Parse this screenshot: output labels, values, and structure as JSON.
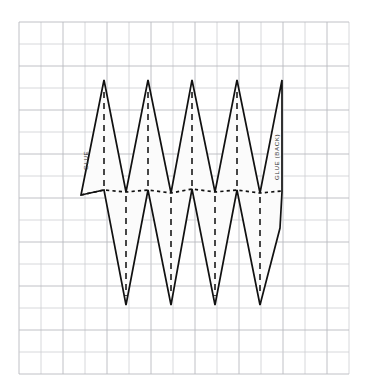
{
  "diagram": {
    "type": "papercraft-net",
    "background_color": "#ffffff",
    "grid": {
      "visible": true,
      "line_color": "#cdced2",
      "major_line_color": "#b9babf",
      "cell_size": 22,
      "origin_x": 19,
      "origin_y": 22,
      "columns": 15,
      "rows": 16
    },
    "net": {
      "fill_color": "#fbfbfb",
      "stroke_color": "#111111",
      "stroke_width": 1.7,
      "upper_peaks_x": [
        104,
        148,
        192,
        237,
        282
      ],
      "upper_peak_y": 80,
      "lower_valleys_x": [
        126,
        171,
        215,
        260
      ],
      "lower_valley_y": 305,
      "fold_line_y": 190,
      "left_edge_x": 81,
      "right_edge_x": 282
    },
    "fold_lines": {
      "vertical_dashed_color": "#1a1a1a",
      "horizontal_dotted_color": "#111111",
      "dash_pattern": "6 5",
      "dot_pattern": "3.2 3.2"
    },
    "labels": [
      {
        "id": "glue-tab-left",
        "text": "GLUE",
        "rotation": -90,
        "x": 88,
        "y": 170,
        "color": "#333333"
      },
      {
        "id": "glue-tab-right",
        "text": "GLUE (BACK)",
        "rotation": -90,
        "x": 279,
        "y": 178,
        "color": "#333333"
      }
    ]
  }
}
